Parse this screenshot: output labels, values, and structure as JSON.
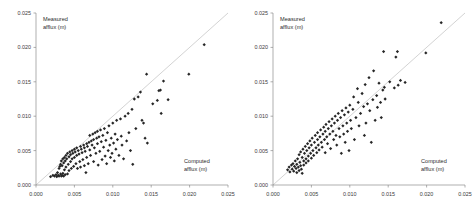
{
  "figure": {
    "background": "#ffffff",
    "marker_color": "#262626",
    "reference_line_color": "#c8c8c8",
    "axis_color": "#8d8d8d"
  },
  "chart_data": [
    {
      "type": "scatter",
      "panel": "left",
      "title": "",
      "xlabel": "Computed",
      "xlabel_line2": "afflux (m)",
      "ylabel": "Measured",
      "ylabel_line2": "afflux (m)",
      "xlim": [
        0.0,
        0.025
      ],
      "ylim": [
        0.0,
        0.025
      ],
      "xticks": [
        0.0,
        0.005,
        0.01,
        0.015,
        0.02,
        0.025
      ],
      "yticks": [
        0.0,
        0.005,
        0.01,
        0.015,
        0.02,
        0.025
      ],
      "xticklabels": [
        "0.000",
        "0.005",
        "0.010",
        "0.015",
        "0.020",
        "0.025"
      ],
      "yticklabels": [
        "0.000",
        "0.005",
        "0.010",
        "0.015",
        "0.020",
        "0.025"
      ],
      "grid": false,
      "legend": false,
      "reference_line": {
        "from": [
          0.0,
          0.0
        ],
        "to": [
          0.025,
          0.025
        ],
        "label": "1:1 line"
      },
      "points": [
        [
          0.0019,
          0.0012
        ],
        [
          0.0022,
          0.0014
        ],
        [
          0.0024,
          0.0013
        ],
        [
          0.0026,
          0.0015
        ],
        [
          0.0027,
          0.0012
        ],
        [
          0.0028,
          0.0018
        ],
        [
          0.0029,
          0.0014
        ],
        [
          0.003,
          0.0024
        ],
        [
          0.003,
          0.0013
        ],
        [
          0.0031,
          0.0027
        ],
        [
          0.0032,
          0.0016
        ],
        [
          0.0032,
          0.003
        ],
        [
          0.0033,
          0.0013
        ],
        [
          0.0033,
          0.0035
        ],
        [
          0.0034,
          0.0028
        ],
        [
          0.0034,
          0.0014
        ],
        [
          0.0035,
          0.0038
        ],
        [
          0.0035,
          0.0017
        ],
        [
          0.0036,
          0.0032
        ],
        [
          0.0036,
          0.0013
        ],
        [
          0.0037,
          0.004
        ],
        [
          0.0037,
          0.0022
        ],
        [
          0.0038,
          0.0035
        ],
        [
          0.0038,
          0.0015
        ],
        [
          0.0039,
          0.0043
        ],
        [
          0.0039,
          0.0026
        ],
        [
          0.004,
          0.0038
        ],
        [
          0.0041,
          0.0016
        ],
        [
          0.0041,
          0.0046
        ],
        [
          0.0042,
          0.003
        ],
        [
          0.0043,
          0.0041
        ],
        [
          0.0043,
          0.0021
        ],
        [
          0.0044,
          0.0048
        ],
        [
          0.0045,
          0.0034
        ],
        [
          0.0045,
          0.0044
        ],
        [
          0.0046,
          0.0024
        ],
        [
          0.0047,
          0.005
        ],
        [
          0.0047,
          0.0038
        ],
        [
          0.0048,
          0.0046
        ],
        [
          0.0049,
          0.0027
        ],
        [
          0.005,
          0.0052
        ],
        [
          0.005,
          0.004
        ],
        [
          0.0051,
          0.0048
        ],
        [
          0.0052,
          0.0031
        ],
        [
          0.0053,
          0.0054
        ],
        [
          0.0053,
          0.0043
        ],
        [
          0.0054,
          0.0024
        ],
        [
          0.0055,
          0.005
        ],
        [
          0.0056,
          0.0045
        ],
        [
          0.0057,
          0.0034
        ],
        [
          0.0058,
          0.0056
        ],
        [
          0.0058,
          0.0026
        ],
        [
          0.0059,
          0.0052
        ],
        [
          0.006,
          0.0047
        ],
        [
          0.0061,
          0.0037
        ],
        [
          0.0062,
          0.0058
        ],
        [
          0.0063,
          0.0028
        ],
        [
          0.0063,
          0.0054
        ],
        [
          0.0064,
          0.0049
        ],
        [
          0.0065,
          0.0018
        ],
        [
          0.0066,
          0.006
        ],
        [
          0.0066,
          0.004
        ],
        [
          0.0067,
          0.0056
        ],
        [
          0.0068,
          0.0031
        ],
        [
          0.0069,
          0.0062
        ],
        [
          0.007,
          0.0051
        ],
        [
          0.007,
          0.0072
        ],
        [
          0.0071,
          0.0043
        ],
        [
          0.0072,
          0.0064
        ],
        [
          0.0073,
          0.0058
        ],
        [
          0.0074,
          0.0074
        ],
        [
          0.0075,
          0.0034
        ],
        [
          0.0075,
          0.0066
        ],
        [
          0.0076,
          0.0054
        ],
        [
          0.0077,
          0.0076
        ],
        [
          0.0078,
          0.0046
        ],
        [
          0.0079,
          0.0068
        ],
        [
          0.008,
          0.006
        ],
        [
          0.008,
          0.0078
        ],
        [
          0.0081,
          0.0029
        ],
        [
          0.0082,
          0.007
        ],
        [
          0.0083,
          0.0049
        ],
        [
          0.0084,
          0.008
        ],
        [
          0.0085,
          0.0063
        ],
        [
          0.0086,
          0.0037
        ],
        [
          0.0087,
          0.0072
        ],
        [
          0.0088,
          0.0055
        ],
        [
          0.0089,
          0.0082
        ],
        [
          0.009,
          0.0042
        ],
        [
          0.0091,
          0.0065
        ],
        [
          0.0092,
          0.0031
        ],
        [
          0.0093,
          0.0076
        ],
        [
          0.0094,
          0.005
        ],
        [
          0.0095,
          0.0086
        ],
        [
          0.0096,
          0.0058
        ],
        [
          0.0097,
          0.004
        ],
        [
          0.0098,
          0.0068
        ],
        [
          0.0099,
          0.0046
        ],
        [
          0.01,
          0.009
        ],
        [
          0.0101,
          0.0061
        ],
        [
          0.0102,
          0.0035
        ],
        [
          0.0103,
          0.0074
        ],
        [
          0.0104,
          0.0052
        ],
        [
          0.0105,
          0.0094
        ],
        [
          0.0106,
          0.0066
        ],
        [
          0.0108,
          0.0043
        ],
        [
          0.011,
          0.0096
        ],
        [
          0.0111,
          0.0071
        ],
        [
          0.0112,
          0.0058
        ],
        [
          0.0114,
          0.0038
        ],
        [
          0.0116,
          0.01
        ],
        [
          0.0118,
          0.0064
        ],
        [
          0.012,
          0.0104
        ],
        [
          0.0121,
          0.0076
        ],
        [
          0.0123,
          0.005
        ],
        [
          0.0125,
          0.011
        ],
        [
          0.0126,
          0.003
        ],
        [
          0.0128,
          0.0125
        ],
        [
          0.013,
          0.0082
        ],
        [
          0.0133,
          0.0128
        ],
        [
          0.0136,
          0.0135
        ],
        [
          0.0138,
          0.0094
        ],
        [
          0.014,
          0.009
        ],
        [
          0.0142,
          0.0068
        ],
        [
          0.0144,
          0.0161
        ],
        [
          0.0145,
          0.0061
        ],
        [
          0.0152,
          0.0118
        ],
        [
          0.0158,
          0.0123
        ],
        [
          0.016,
          0.0137
        ],
        [
          0.0162,
          0.0138
        ],
        [
          0.0163,
          0.0104
        ],
        [
          0.0166,
          0.0151
        ],
        [
          0.0172,
          0.0124
        ],
        [
          0.0199,
          0.0161
        ],
        [
          0.0219,
          0.0204
        ]
      ]
    },
    {
      "type": "scatter",
      "panel": "right",
      "title": "",
      "xlabel": "Computed",
      "xlabel_line2": "afflux (m)",
      "ylabel": "Measured",
      "ylabel_line2": "afflux (m)",
      "xlim": [
        0.0,
        0.025
      ],
      "ylim": [
        0.0,
        0.025
      ],
      "xticks": [
        0.0,
        0.005,
        0.01,
        0.015,
        0.02,
        0.025
      ],
      "yticks": [
        0.0,
        0.005,
        0.01,
        0.015,
        0.02,
        0.025
      ],
      "xticklabels": [
        "0.000",
        "0.005",
        "0.010",
        "0.015",
        "0.020",
        "0.025"
      ],
      "yticklabels": [
        "0.000",
        "0.005",
        "0.010",
        "0.015",
        "0.020",
        "0.025"
      ],
      "grid": false,
      "legend": false,
      "reference_line": {
        "from": [
          0.0,
          0.0
        ],
        "to": [
          0.025,
          0.025
        ],
        "label": "1:1 line"
      },
      "points": [
        [
          0.0019,
          0.0022
        ],
        [
          0.0021,
          0.0026
        ],
        [
          0.0022,
          0.0019
        ],
        [
          0.0024,
          0.0029
        ],
        [
          0.0025,
          0.0023
        ],
        [
          0.0026,
          0.0031
        ],
        [
          0.0027,
          0.002
        ],
        [
          0.0028,
          0.0027
        ],
        [
          0.0029,
          0.0035
        ],
        [
          0.003,
          0.0024
        ],
        [
          0.0031,
          0.0018
        ],
        [
          0.0031,
          0.003
        ],
        [
          0.0032,
          0.0038
        ],
        [
          0.0033,
          0.0026
        ],
        [
          0.0034,
          0.0021
        ],
        [
          0.0034,
          0.0044
        ],
        [
          0.0035,
          0.0033
        ],
        [
          0.0036,
          0.0028
        ],
        [
          0.0036,
          0.0048
        ],
        [
          0.0037,
          0.0023
        ],
        [
          0.0038,
          0.004
        ],
        [
          0.0038,
          0.0017
        ],
        [
          0.0039,
          0.0052
        ],
        [
          0.004,
          0.0035
        ],
        [
          0.004,
          0.0029
        ],
        [
          0.0041,
          0.0046
        ],
        [
          0.0042,
          0.0056
        ],
        [
          0.0043,
          0.0038
        ],
        [
          0.0043,
          0.0032
        ],
        [
          0.0044,
          0.005
        ],
        [
          0.0045,
          0.006
        ],
        [
          0.0046,
          0.0042
        ],
        [
          0.0046,
          0.0035
        ],
        [
          0.0047,
          0.0054
        ],
        [
          0.0048,
          0.0064
        ],
        [
          0.0049,
          0.0046
        ],
        [
          0.005,
          0.0039
        ],
        [
          0.005,
          0.0058
        ],
        [
          0.0051,
          0.0068
        ],
        [
          0.0052,
          0.005
        ],
        [
          0.0053,
          0.0043
        ],
        [
          0.0054,
          0.0062
        ],
        [
          0.0055,
          0.0072
        ],
        [
          0.0056,
          0.0054
        ],
        [
          0.0057,
          0.0047
        ],
        [
          0.0058,
          0.0066
        ],
        [
          0.0058,
          0.0076
        ],
        [
          0.0059,
          0.0058
        ],
        [
          0.006,
          0.0051
        ],
        [
          0.0061,
          0.007
        ],
        [
          0.0062,
          0.008
        ],
        [
          0.0063,
          0.0062
        ],
        [
          0.0064,
          0.0055
        ],
        [
          0.0065,
          0.0074
        ],
        [
          0.0066,
          0.0084
        ],
        [
          0.0067,
          0.0066
        ],
        [
          0.0068,
          0.0047
        ],
        [
          0.0068,
          0.0078
        ],
        [
          0.0069,
          0.0088
        ],
        [
          0.007,
          0.007
        ],
        [
          0.0071,
          0.006
        ],
        [
          0.0072,
          0.0082
        ],
        [
          0.0073,
          0.0092
        ],
        [
          0.0074,
          0.0074
        ],
        [
          0.0075,
          0.0053
        ],
        [
          0.0076,
          0.0086
        ],
        [
          0.0077,
          0.0096
        ],
        [
          0.0078,
          0.0078
        ],
        [
          0.0079,
          0.0066
        ],
        [
          0.008,
          0.009
        ],
        [
          0.0081,
          0.01
        ],
        [
          0.0082,
          0.0072
        ],
        [
          0.0083,
          0.0058
        ],
        [
          0.0084,
          0.0094
        ],
        [
          0.0085,
          0.0104
        ],
        [
          0.0086,
          0.0082
        ],
        [
          0.0087,
          0.007
        ],
        [
          0.0088,
          0.0098
        ],
        [
          0.0089,
          0.0046
        ],
        [
          0.009,
          0.0108
        ],
        [
          0.0091,
          0.0086
        ],
        [
          0.0092,
          0.0074
        ],
        [
          0.0093,
          0.0102
        ],
        [
          0.0094,
          0.0062
        ],
        [
          0.0095,
          0.0112
        ],
        [
          0.0096,
          0.009
        ],
        [
          0.0097,
          0.0078
        ],
        [
          0.0098,
          0.0106
        ],
        [
          0.0099,
          0.005
        ],
        [
          0.01,
          0.0116
        ],
        [
          0.0101,
          0.0094
        ],
        [
          0.0102,
          0.0082
        ],
        [
          0.0104,
          0.011
        ],
        [
          0.0105,
          0.0128
        ],
        [
          0.0106,
          0.0066
        ],
        [
          0.0108,
          0.0098
        ],
        [
          0.011,
          0.014
        ],
        [
          0.0111,
          0.012
        ],
        [
          0.0112,
          0.0086
        ],
        [
          0.0114,
          0.0104
        ],
        [
          0.0116,
          0.0133
        ],
        [
          0.0118,
          0.0114
        ],
        [
          0.0119,
          0.0072
        ],
        [
          0.012,
          0.0146
        ],
        [
          0.0121,
          0.009
        ],
        [
          0.0123,
          0.0118
        ],
        [
          0.0125,
          0.0156
        ],
        [
          0.0126,
          0.0108
        ],
        [
          0.0128,
          0.0062
        ],
        [
          0.013,
          0.0124
        ],
        [
          0.0131,
          0.0166
        ],
        [
          0.0133,
          0.0094
        ],
        [
          0.0135,
          0.013
        ],
        [
          0.0136,
          0.0113
        ],
        [
          0.0138,
          0.0148
        ],
        [
          0.014,
          0.012
        ],
        [
          0.0141,
          0.0098
        ],
        [
          0.0143,
          0.0138
        ],
        [
          0.0144,
          0.0194
        ],
        [
          0.0145,
          0.0142
        ],
        [
          0.0146,
          0.0125
        ],
        [
          0.0152,
          0.015
        ],
        [
          0.0158,
          0.0141
        ],
        [
          0.016,
          0.0186
        ],
        [
          0.0162,
          0.0194
        ],
        [
          0.0163,
          0.0145
        ],
        [
          0.0166,
          0.0152
        ],
        [
          0.0172,
          0.0149
        ],
        [
          0.0199,
          0.0192
        ],
        [
          0.0219,
          0.0236
        ]
      ]
    }
  ]
}
